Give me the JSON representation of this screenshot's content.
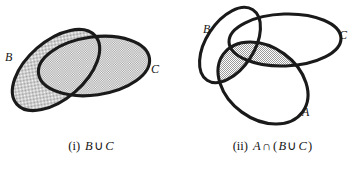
{
  "figure": {
    "background_color": "#ffffff",
    "stroke_color": "#1a1a1a",
    "shade_color": "#c9c9c9",
    "panels": [
      {
        "id": "union",
        "caption_number": "(i)",
        "caption_expression": "B ∪ C",
        "caption_parts": {
          "lead": "B",
          "operator": "∪",
          "trail": "C"
        },
        "sets": [
          {
            "name": "A",
            "label": "B",
            "label_x": 5,
            "label_y": 49
          },
          {
            "name": "B",
            "label": "C",
            "label_x": 151,
            "label_y": 61
          }
        ],
        "shaded_region": "B ∪ C"
      },
      {
        "id": "intersection",
        "caption_number": "(ii)",
        "caption_expression": "A ∩ (B ∪ C)",
        "caption_parts": {
          "lead": "A",
          "operator": "∩",
          "open": "(",
          "inner_lead": "B",
          "inner_operator": "∪",
          "inner_trail": "C",
          "close": ")"
        },
        "sets": [
          {
            "name": "B",
            "label": "B",
            "label_x": 21,
            "label_y": 21
          },
          {
            "name": "C",
            "label": "C",
            "label_x": 157,
            "label_y": 27
          },
          {
            "name": "A",
            "label": "A",
            "label_x": 120,
            "label_y": 104
          }
        ],
        "shaded_region": "A ∩ (B ∪ C)"
      }
    ]
  }
}
